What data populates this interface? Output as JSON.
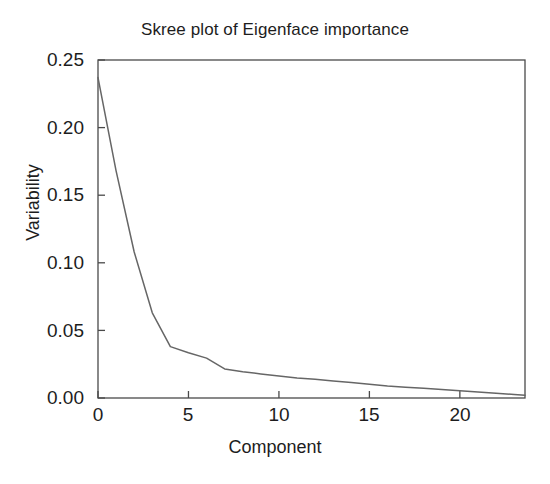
{
  "chart_data": {
    "type": "line",
    "title": "Skree plot of Eigenface importance",
    "xlabel": "Component",
    "ylabel": "Variability",
    "xlim": [
      0,
      23.6
    ],
    "ylim": [
      0.0,
      0.25
    ],
    "grid": false,
    "legend": null,
    "line_color": "#666666",
    "xticks": [
      "0",
      "5",
      "10",
      "15",
      "20"
    ],
    "xtick_values": [
      0,
      5,
      10,
      15,
      20
    ],
    "yticks": [
      "0.00",
      "0.05",
      "0.10",
      "0.15",
      "0.20",
      "0.25"
    ],
    "ytick_values": [
      0.0,
      0.05,
      0.1,
      0.15,
      0.2,
      0.25
    ],
    "x": [
      0,
      1,
      2,
      3,
      4,
      5,
      6,
      7,
      8,
      9,
      10,
      11,
      12,
      13,
      14,
      15,
      16,
      17,
      18,
      19,
      20,
      21,
      22,
      23,
      23.6
    ],
    "values": [
      0.237,
      0.168,
      0.108,
      0.063,
      0.038,
      0.0335,
      0.0295,
      0.0215,
      0.0195,
      0.0178,
      0.0163,
      0.0148,
      0.0138,
      0.0126,
      0.0114,
      0.0101,
      0.0089,
      0.008,
      0.0072,
      0.0062,
      0.0054,
      0.0045,
      0.0036,
      0.0026,
      0.0021
    ],
    "series": [
      {
        "name": "Variability",
        "values": [
          0.237,
          0.168,
          0.108,
          0.063,
          0.038,
          0.0335,
          0.0295,
          0.0215,
          0.0195,
          0.0178,
          0.0163,
          0.0148,
          0.0138,
          0.0126,
          0.0114,
          0.0101,
          0.0089,
          0.008,
          0.0072,
          0.0062,
          0.0054,
          0.0045,
          0.0036,
          0.0026,
          0.0021
        ]
      }
    ]
  }
}
